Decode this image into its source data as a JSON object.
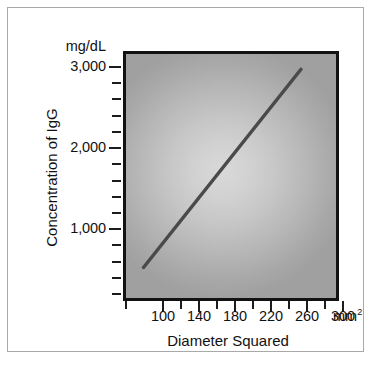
{
  "chart_data": {
    "type": "line",
    "title": "",
    "xlabel": "Diameter Squared",
    "ylabel": "Concentration of IgG",
    "x_unit": "mm",
    "x_unit_superscript": "2",
    "y_unit": "mg/dL",
    "xlim": [
      80,
      320
    ],
    "ylim": [
      0,
      3200
    ],
    "xticks": [
      100,
      140,
      180,
      220,
      260,
      300
    ],
    "xtick_labels": [
      "100",
      "140",
      "180",
      "220",
      "260",
      "300"
    ],
    "xticks_minor": [
      120,
      160,
      200,
      240,
      280
    ],
    "yticks": [
      1000,
      2000,
      3000
    ],
    "ytick_labels": [
      "1,000",
      "2,000",
      "3,000"
    ],
    "yticks_minor": [
      200,
      400,
      600,
      800,
      1200,
      1400,
      1600,
      1800,
      2200,
      2400,
      2600,
      2800,
      3000
    ],
    "grid": false,
    "legend": "none",
    "series": [
      {
        "name": "IgG standard curve",
        "x": [
          100,
          280
        ],
        "y": [
          400,
          3000
        ],
        "color": "#4a4a4a",
        "line_width": 3.5
      }
    ],
    "plot_background": "radial-gradient-gray",
    "plot_bg_center_color": "#d9d9d9",
    "plot_bg_edge_color": "#a0a0a0",
    "plot_border_color": "#121212",
    "frame_border_color": "#a9a9a9",
    "text_color": "#111111"
  },
  "axes": {
    "y": {
      "unit_label": "mg/dL",
      "title": "Concentration of IgG",
      "ticks": [
        {
          "value": 3000,
          "label": "3,000"
        },
        {
          "value": 2000,
          "label": "2,000"
        },
        {
          "value": 1000,
          "label": "1,000"
        }
      ]
    },
    "x": {
      "unit_label": "mm",
      "unit_superscript": "2",
      "title": "Diameter Squared",
      "ticks": [
        {
          "value": 100,
          "label": "100"
        },
        {
          "value": 140,
          "label": "140"
        },
        {
          "value": 180,
          "label": "180"
        },
        {
          "value": 220,
          "label": "220"
        },
        {
          "value": 260,
          "label": "260"
        },
        {
          "value": 300,
          "label": "300"
        }
      ]
    }
  }
}
